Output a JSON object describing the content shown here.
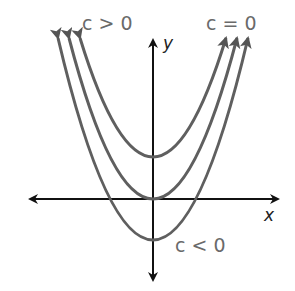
{
  "diagram": {
    "axes": {
      "x_label": "x",
      "y_label": "y"
    },
    "curves": [
      {
        "name": "c > 0",
        "label": "c > 0",
        "vertex_y": 157
      },
      {
        "name": "c = 0",
        "label": "c = 0",
        "vertex_y": 199
      },
      {
        "name": "c < 0",
        "label": "c < 0",
        "vertex_y": 240
      }
    ],
    "colors": {
      "curve": "#5f5f5f",
      "axis": "#111111",
      "label": "#6a6a6a"
    }
  }
}
